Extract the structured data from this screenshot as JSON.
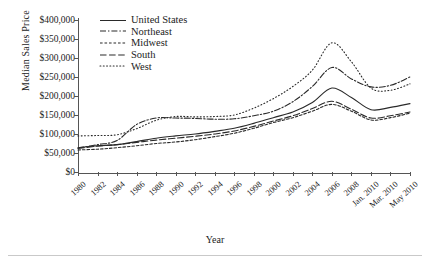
{
  "chart_data": {
    "type": "line",
    "title": "",
    "xlabel": "Year",
    "ylabel": "Median Sales Price",
    "ylim": [
      0,
      400000
    ],
    "ytick_step": 50000,
    "ytick_labels": [
      "$400,000",
      "$350,000",
      "$300,000",
      "$250,000",
      "$200,000",
      "$150,000",
      "$100,000",
      "$50,000",
      "$0"
    ],
    "ytick_values": [
      400000,
      350000,
      300000,
      250000,
      200000,
      150000,
      100000,
      50000,
      0
    ],
    "grid": false,
    "legend_position": "top-left",
    "categories": [
      "1980",
      "1982",
      "1984",
      "1986",
      "1988",
      "1990",
      "1992",
      "1994",
      "1996",
      "1998",
      "2000",
      "2002",
      "2004",
      "2006",
      "2008",
      "Jan. 2010",
      "Mar. 2010",
      "May 2010"
    ],
    "series": [
      {
        "name": "United States",
        "style": "solid",
        "values": [
          64000,
          69000,
          72000,
          80000,
          89000,
          95000,
          100000,
          107000,
          115000,
          128000,
          143000,
          158000,
          183000,
          221000,
          196000,
          164000,
          170000,
          180000
        ]
      },
      {
        "name": "Northeast",
        "style": "dash-dot",
        "values": [
          63000,
          72000,
          83000,
          125000,
          142000,
          142000,
          141000,
          139000,
          140000,
          148000,
          160000,
          185000,
          225000,
          275000,
          245000,
          224000,
          228000,
          250000
        ]
      },
      {
        "name": "Midwest",
        "style": "fine-dash",
        "values": [
          58000,
          60000,
          64000,
          69000,
          75000,
          79000,
          85000,
          93000,
          102000,
          115000,
          130000,
          143000,
          160000,
          178000,
          160000,
          137000,
          143000,
          155000
        ]
      },
      {
        "name": "South",
        "style": "dash",
        "values": [
          62000,
          68000,
          72000,
          78000,
          84000,
          89000,
          94000,
          100000,
          108000,
          120000,
          134000,
          148000,
          167000,
          186000,
          165000,
          142000,
          148000,
          158000
        ]
      },
      {
        "name": "West",
        "style": "dotted",
        "values": [
          95000,
          96000,
          98000,
          114000,
          136000,
          146000,
          145000,
          146000,
          150000,
          168000,
          193000,
          225000,
          268000,
          340000,
          290000,
          221000,
          215000,
          232000
        ]
      }
    ]
  }
}
